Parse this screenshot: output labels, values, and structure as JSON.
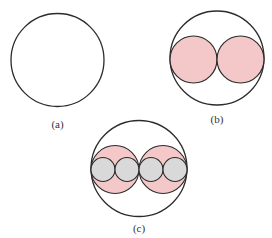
{
  "figure": {
    "panels": [
      {
        "id": "a",
        "label": "(a)",
        "outer": {
          "cx": 57.5,
          "cy": 60,
          "r": 46.5
        },
        "inner_pink": [],
        "inner_gray": []
      },
      {
        "id": "b",
        "label": "(b)",
        "outer": {
          "cx": 217,
          "cy": 58,
          "r": 47
        },
        "inner_pink": [
          {
            "cx": 193.5,
            "cy": 59.5,
            "r": 23.5
          },
          {
            "cx": 240.5,
            "cy": 59.5,
            "r": 23.5
          }
        ],
        "inner_gray": []
      },
      {
        "id": "c",
        "label": "(c)",
        "outer": {
          "cx": 139,
          "cy": 168.5,
          "r": 48
        },
        "inner_pink": [
          {
            "cx": 115,
            "cy": 169.5,
            "r": 24
          },
          {
            "cx": 163,
            "cy": 169.5,
            "r": 24
          }
        ],
        "inner_gray": [
          {
            "cx": 103,
            "cy": 169.5,
            "r": 12
          },
          {
            "cx": 127,
            "cy": 169.5,
            "r": 12
          },
          {
            "cx": 151,
            "cy": 169.5,
            "r": 12
          },
          {
            "cx": 175,
            "cy": 169.5,
            "r": 12
          }
        ]
      }
    ],
    "colors": {
      "stroke": "#2b2b2b",
      "pink_fill": "#f4c8c8",
      "gray_fill": "#d9d9d9",
      "background": "#ffffff"
    }
  }
}
